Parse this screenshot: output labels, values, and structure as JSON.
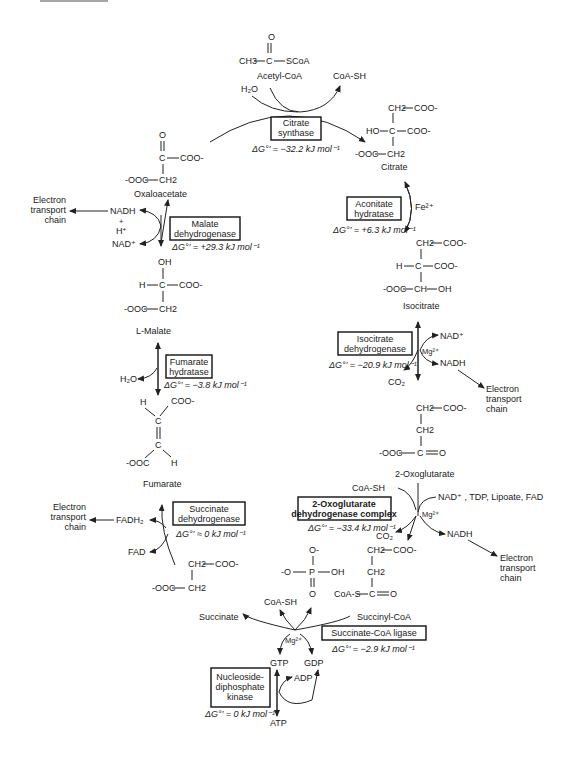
{
  "diagram": {
    "metabolites": {
      "acetyl_coa": {
        "name": "Acetyl-CoA",
        "formula": [
          "CH3",
          "C",
          "SCoA",
          "O"
        ]
      },
      "citrate": {
        "name": "Citrate",
        "formula": [
          "CH2",
          "COO-",
          "HO",
          "C",
          "COO-",
          "-OOC",
          "CH2"
        ]
      },
      "isocitrate": {
        "name": "Isocitrate",
        "formula": [
          "CH2",
          "COO-",
          "H",
          "C",
          "COO-",
          "-OOC",
          "CH",
          "OH"
        ]
      },
      "oxoglutarate": {
        "name": "2-Oxoglutarate",
        "formula": [
          "CH2",
          "COO-",
          "CH2",
          "-OOC",
          "C",
          "O"
        ]
      },
      "succinyl_coa": {
        "name": "Succinyl-CoA",
        "formula": [
          "CH2",
          "COO-",
          "CH2",
          "CoA-S",
          "C",
          "O"
        ]
      },
      "succinate": {
        "name": "Succinate",
        "formula": [
          "CH2",
          "COO-",
          "-OOC",
          "CH2"
        ]
      },
      "fumarate": {
        "name": "Fumarate",
        "formula": [
          "H",
          "COO-",
          "C",
          "C",
          "-OOC",
          "H"
        ]
      },
      "malate": {
        "name": "L-Malate",
        "formula": [
          "OH",
          "H",
          "C",
          "COO-",
          "-OOC",
          "CH2"
        ]
      },
      "oxaloacetate": {
        "name": "Oxaloacetate",
        "formula": [
          "O",
          "C",
          "COO-",
          "-OOC",
          "CH2"
        ]
      },
      "phosphate": {
        "formula": [
          "O-",
          "-O",
          "P",
          "OH",
          "O"
        ]
      }
    },
    "enzymes": [
      {
        "id": "citrate_synthase",
        "line1": "Citrate",
        "line2": "synthase",
        "dg": "ΔG°′ = −32.2 kJ mol⁻¹"
      },
      {
        "id": "aconitate_hydratase",
        "line1": "Aconitate",
        "line2": "hydratase",
        "dg": "ΔG°′ = +6.3 kJ mol⁻¹",
        "cofactor": "Fe²⁺"
      },
      {
        "id": "isocitrate_dehydrogenase",
        "line1": "Isocitrate",
        "line2": "dehydrogenase",
        "dg": "ΔG°′ = −20.9 kJ mol⁻¹",
        "cofactor": "Mg²⁺"
      },
      {
        "id": "oxoglutarate_dh_complex",
        "line1": "2-Oxoglutarate",
        "line2": "dehydrogenase complex",
        "dg": "ΔG°′ = −33.4 kJ mol⁻¹",
        "cofactor": "Mg²⁺"
      },
      {
        "id": "succinate_coa_ligase",
        "line1": "Succinate-CoA ligase",
        "line2": "",
        "dg": "ΔG°′ = −2.9 kJ mol⁻¹",
        "cofactor": "Mg²⁺"
      },
      {
        "id": "ndp_kinase",
        "line1": "Nucleoside-",
        "line2": "diphosphate",
        "line3": "kinase",
        "dg": "ΔG°′ = 0 kJ mol⁻¹"
      },
      {
        "id": "succinate_dehydrogenase",
        "line1": "Succinate",
        "line2": "dehydrogenase",
        "dg": "ΔG°′ ≈ 0 kJ mol⁻¹"
      },
      {
        "id": "fumarate_hydratase",
        "line1": "Fumarate",
        "line2": "hydratase",
        "dg": "ΔG°′ = −3.8 kJ mol⁻¹"
      },
      {
        "id": "malate_dehydrogenase",
        "line1": "Malate",
        "line2": "dehydrogenase",
        "dg": "ΔG°′ = +29.3 kJ mol⁻¹"
      }
    ],
    "cosubstrates": {
      "h2o_1": "H₂O",
      "coash_1": "CoA-SH",
      "nad_1": "NAD⁺",
      "nadh_1": "NADH",
      "co2_1": "CO₂",
      "coash_2": "CoA-SH",
      "nad_2": "NAD⁺ , TDP, Lipoate, FAD",
      "nadh_2": "NADH",
      "co2_2": "CO₂",
      "coash_3": "CoA-SH",
      "gtp": "GTP",
      "gdp": "GDP",
      "adp": "ADP",
      "atp": "ATP",
      "fadh2": "FADH₂",
      "fad": "FAD",
      "h2o_2": "H₂O",
      "nadh_3": "NADH",
      "h_plus": "H⁺",
      "plus": "+",
      "nad_3": "NAD⁺"
    },
    "etc_label": [
      "Electron",
      "transport",
      "chain"
    ]
  }
}
